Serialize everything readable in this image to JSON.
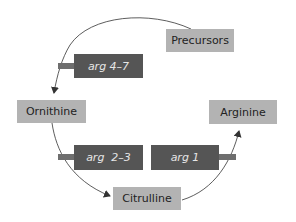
{
  "diagram": {
    "type": "metabolic-pathway",
    "colors": {
      "metabolite_box": "#b3b3b3",
      "gene_box": "#555555",
      "gene_text": "#e6e6e6",
      "arrow": "#333333"
    },
    "metabolites": [
      {
        "id": "precursors",
        "label": "Precursors"
      },
      {
        "id": "ornithine",
        "label": "Ornithine"
      },
      {
        "id": "citrulline",
        "label": "Citrulline"
      },
      {
        "id": "arginine",
        "label": "Arginine"
      }
    ],
    "genes": [
      {
        "id": "arg4-7",
        "label": "arg 4–7",
        "step": "Precursors → Ornithine"
      },
      {
        "id": "arg2-3",
        "label": "arg  2–3",
        "step": "Ornithine → Citrulline"
      },
      {
        "id": "arg1",
        "label": "arg 1",
        "step": "Citrulline → Arginine"
      }
    ],
    "edges": [
      {
        "from": "Precursors",
        "to": "Ornithine",
        "enzyme_genes": "arg 4–7"
      },
      {
        "from": "Ornithine",
        "to": "Citrulline",
        "enzyme_genes": "arg 2–3"
      },
      {
        "from": "Citrulline",
        "to": "Arginine",
        "enzyme_genes": "arg 1"
      }
    ]
  }
}
